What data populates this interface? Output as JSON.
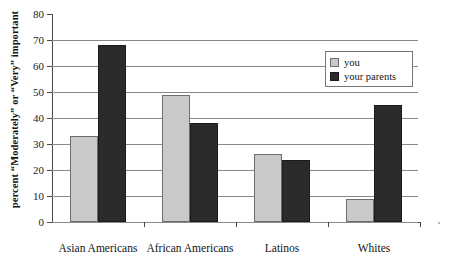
{
  "chart_data": {
    "type": "bar",
    "title": "",
    "subtitle": "",
    "xlabel": "",
    "ylabel": "percent “Moderately” or “Very” important",
    "categories": [
      "Asian Americans",
      "African Americans",
      "Latinos",
      "Whites"
    ],
    "series": [
      {
        "name": "you",
        "color": "#c9c9c9",
        "values": [
          33,
          49,
          26,
          9
        ]
      },
      {
        "name": "your parents",
        "color": "#2b2b2b",
        "values": [
          68,
          38,
          24,
          45
        ]
      }
    ],
    "ylim": [
      0,
      80
    ],
    "ytick_step": 10,
    "yticks": [
      0,
      10,
      20,
      30,
      40,
      50,
      60,
      70,
      80
    ],
    "ytick_labels": [
      "0",
      "10",
      "20",
      "30",
      "40",
      "50",
      "60",
      "70",
      "80"
    ],
    "grid": true,
    "grid_axis": "y",
    "legend_position": "top-right",
    "legend_entries": [
      "you",
      "your parents"
    ]
  },
  "axis": {
    "y_title": "percent “Moderately” or “Very” important"
  },
  "legend": {
    "entries": [
      {
        "label": "you"
      },
      {
        "label": "your parents"
      }
    ]
  }
}
